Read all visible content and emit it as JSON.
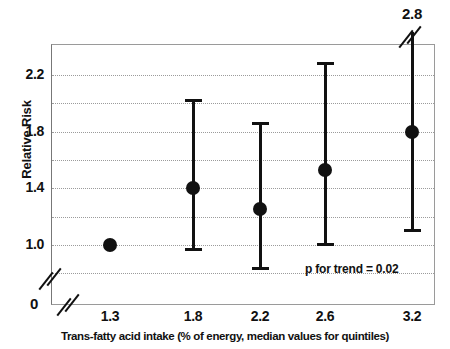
{
  "chart_data": {
    "type": "scatter",
    "title": "",
    "xlabel": "Trans-fatty acid intake  (% of energy, median values for quintiles)",
    "ylabel": "Relative Risk",
    "x_tick_labels": [
      "1.3",
      "1.8",
      "2.2",
      "2.6",
      "3.2"
    ],
    "x": [
      1.3,
      1.8,
      2.2,
      2.6,
      3.2
    ],
    "y_tick_labels": [
      "2.2",
      "1.8",
      "1.4",
      "1.0"
    ],
    "y_zero_label": "0",
    "y_ticks": [
      2.2,
      1.8,
      1.4,
      1.0
    ],
    "gridlines": [
      2.2,
      2.0,
      1.8,
      1.6,
      1.4,
      1.2,
      1.0,
      0.8
    ],
    "ylim": [
      0.73,
      2.33
    ],
    "grid": true,
    "legend": "none",
    "axis_break_y": true,
    "axis_break_x": true,
    "series": [
      {
        "name": "Relative Risk",
        "values": [
          1.0,
          1.4,
          1.25,
          1.53,
          1.8
        ],
        "ci_low": [
          null,
          0.96,
          0.83,
          1.0,
          1.1
        ],
        "ci_high": [
          null,
          2.03,
          1.87,
          2.29,
          2.8
        ],
        "ci_high_clipped": [
          false,
          false,
          false,
          false,
          true
        ]
      }
    ],
    "annotations": [
      {
        "name": "top-value-label",
        "text": "2.8",
        "x": 3.2
      },
      {
        "name": "p-for-trend",
        "text": "p for trend = 0.02"
      }
    ]
  },
  "axes": {
    "y_label": "Relative Risk",
    "x_label": "Trans-fatty acid intake  (% of energy, median values for quintiles)",
    "y_zero": "0"
  },
  "colors": {
    "marker": "#111111",
    "grid": "#9b9b9b",
    "frame": "#9a9a9a",
    "background": "#ffffff"
  }
}
